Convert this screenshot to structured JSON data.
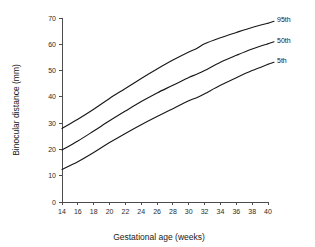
{
  "chart_data": {
    "type": "line",
    "title": "",
    "xlabel": "Gestational age (weeks)",
    "ylabel": "Binocular distance (mm)",
    "xlim": [
      14,
      40
    ],
    "ylim": [
      0,
      70
    ],
    "xticks": [
      14,
      16,
      18,
      20,
      22,
      24,
      26,
      28,
      30,
      32,
      34,
      36,
      38,
      40
    ],
    "yticks": [
      0,
      10,
      20,
      30,
      40,
      50,
      60,
      70
    ],
    "grid": false,
    "legend_position": "right-inline-labels",
    "x": [
      14,
      16,
      18,
      20,
      22,
      24,
      26,
      28,
      30,
      31,
      32,
      34,
      36,
      38,
      40
    ],
    "series": [
      {
        "name": "95th",
        "label": "95th",
        "color": "#171717",
        "values": [
          28.0,
          31.5,
          35.3,
          39.4,
          43.2,
          47.0,
          50.6,
          54.0,
          57.1,
          58.4,
          60.2,
          62.5,
          64.5,
          66.4,
          68.0
        ]
      },
      {
        "name": "50th",
        "label": "50th",
        "color": "#171717",
        "values": [
          19.8,
          23.2,
          27.0,
          30.9,
          34.6,
          38.2,
          41.5,
          44.4,
          47.4,
          48.6,
          50.0,
          53.2,
          55.8,
          58.2,
          60.2
        ]
      },
      {
        "name": "5th",
        "label": "5th",
        "color": "#171717",
        "values": [
          12.4,
          15.3,
          18.8,
          22.6,
          26.1,
          29.4,
          32.5,
          35.5,
          38.5,
          39.7,
          41.2,
          44.4,
          47.3,
          50.0,
          52.4
        ]
      }
    ]
  },
  "axis": {
    "x_title": "Gestational age (weeks)",
    "y_title": "Binocular distance (mm)"
  },
  "labels": {
    "p95": "95th",
    "p50": "50th",
    "p5": "5th"
  }
}
